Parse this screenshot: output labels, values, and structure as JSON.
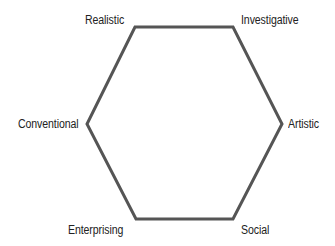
{
  "diagram": {
    "type": "hexagon",
    "stroke_color": "#555555",
    "stroke_width": 3,
    "vertices": [
      {
        "name": "Realistic",
        "x": 135,
        "y": 27
      },
      {
        "name": "Investigative",
        "x": 233,
        "y": 27
      },
      {
        "name": "Artistic",
        "x": 282,
        "y": 124
      },
      {
        "name": "Social",
        "x": 233,
        "y": 219
      },
      {
        "name": "Enterprising",
        "x": 136,
        "y": 219
      },
      {
        "name": "Conventional",
        "x": 87,
        "y": 124
      }
    ],
    "labels": {
      "realistic": "Realistic",
      "investigative": "Investigative",
      "artistic": "Artistic",
      "social": "Social",
      "enterprising": "Enterprising",
      "conventional": "Conventional"
    }
  }
}
